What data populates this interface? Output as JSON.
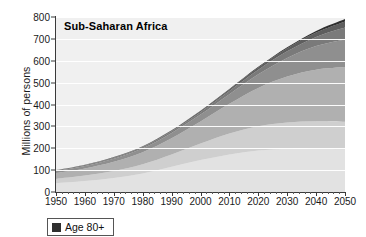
{
  "chart_data": {
    "type": "area",
    "stacked": true,
    "title": "Sub-Saharan Africa",
    "xlabel": "",
    "ylabel": "Millions of persons",
    "xlim": [
      1950,
      2050
    ],
    "ylim": [
      0,
      800
    ],
    "ytick_step": 100,
    "xtick_step": 10,
    "grid": true,
    "legend_position": "below-left",
    "x": [
      1950,
      1960,
      1970,
      1980,
      1990,
      2000,
      2010,
      2020,
      2030,
      2040,
      2050
    ],
    "xtick_labels": [
      "1950",
      "1960",
      "1970",
      "1980",
      "1990",
      "2000",
      "2010",
      "2020",
      "2030",
      "2040",
      "2050"
    ],
    "ytick_labels": [
      "0",
      "100",
      "200",
      "300",
      "400",
      "500",
      "600",
      "700",
      "800"
    ],
    "series": [
      {
        "name": "Age 0-14",
        "color": "#e2e2e2",
        "values": [
          40,
          50,
          64,
          85,
          115,
          146,
          172,
          190,
          198,
          198,
          195
        ]
      },
      {
        "name": "Age 15-24",
        "color": "#cfcfcf",
        "values": [
          20,
          25,
          32,
          42,
          57,
          76,
          96,
          111,
          120,
          125,
          126
        ]
      },
      {
        "name": "Age 25-44",
        "color": "#b0b0b0",
        "values": [
          27,
          33,
          42,
          55,
          74,
          100,
          135,
          175,
          210,
          236,
          250
        ]
      },
      {
        "name": "Age 45-59",
        "color": "#8f8f8f",
        "values": [
          9,
          11,
          14,
          18,
          24,
          32,
          44,
          62,
          85,
          108,
          126
        ]
      },
      {
        "name": "Age 60-69",
        "color": "#7a7a7a",
        "values": [
          3,
          4,
          5,
          6,
          8,
          11,
          15,
          21,
          30,
          42,
          55
        ]
      },
      {
        "name": "Age 70-79",
        "color": "#5e5e5e",
        "values": [
          1,
          1.5,
          2,
          2.5,
          3.5,
          5,
          7,
          10,
          14,
          20,
          28
        ]
      },
      {
        "name": "Age 80+",
        "color": "#2f2f2f",
        "values": [
          0.3,
          0.4,
          0.6,
          0.8,
          1.1,
          1.6,
          2.3,
          3.3,
          5,
          7.5,
          11
        ]
      }
    ],
    "totals": [
      100,
      125,
      160,
      209,
      283,
      372,
      471,
      572,
      662,
      736,
      791
    ],
    "annotations": []
  },
  "legend": {
    "entries": [
      {
        "label": "Age 80+",
        "color": "#2f2f2f",
        "swatch_name": "legend-swatch-age-80-plus"
      }
    ]
  }
}
